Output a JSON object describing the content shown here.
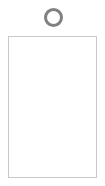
{
  "canvas": {
    "width": 105,
    "height": 186,
    "background_color": "#ffffff"
  },
  "figure": {
    "ring_icon": {
      "name": "ring-icon",
      "shape": "circle-outline",
      "stroke_color": "#808080",
      "fill_color": "#ffffff",
      "outer_diameter_px": 19,
      "stroke_width_px": 3,
      "center_x_px": 53,
      "center_y_px": 17
    },
    "card_body": {
      "name": "card-body",
      "shape": "rectangle",
      "border_color": "#c8c8c8",
      "fill_color": "#ffffff",
      "border_width_px": 1,
      "x_px": 8,
      "y_px": 36,
      "width_px": 89,
      "height_px": 142,
      "content_text": ""
    }
  }
}
